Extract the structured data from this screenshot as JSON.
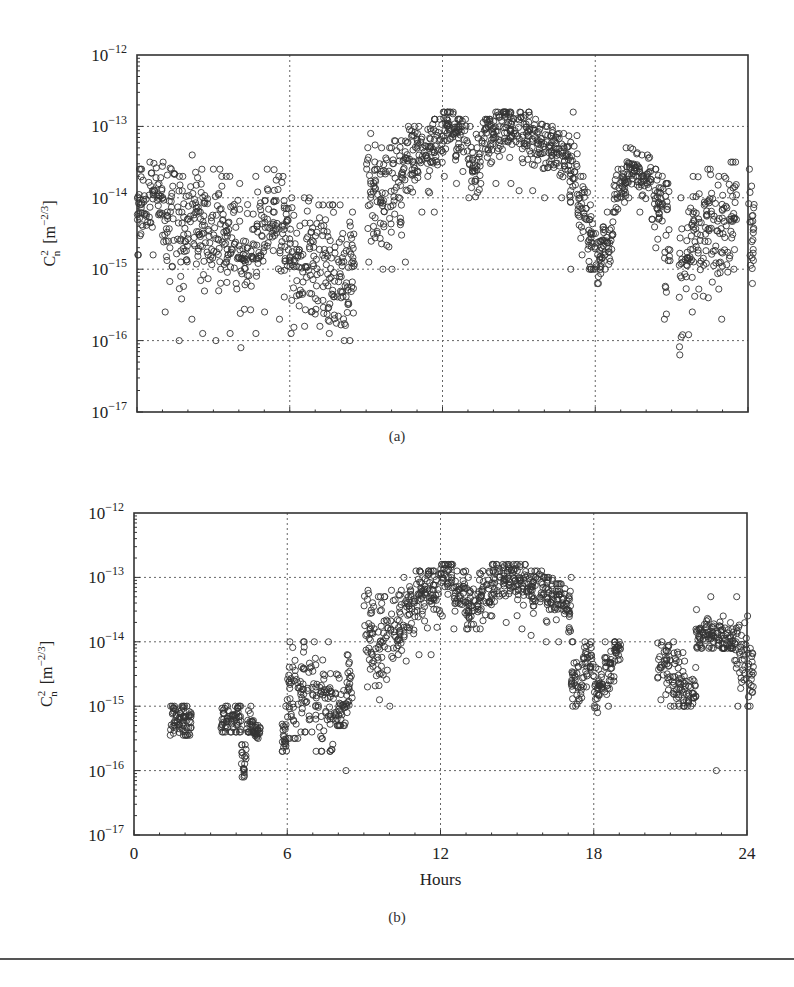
{
  "chart_data": [
    {
      "id": "a",
      "type": "scatter",
      "caption": "(a)",
      "title": "",
      "xlabel": "",
      "ylabel": "C_n^2 [m^-2/3]",
      "ylabel_parts": {
        "base": "C",
        "sup": "2",
        "sub": "n",
        "unit_open": "[m",
        "unit_sup": "−2/3",
        "unit_close": "]"
      },
      "xscale": "linear",
      "yscale": "log",
      "xlim": [
        0,
        24
      ],
      "ylim": [
        1e-17,
        1e-12
      ],
      "xticks": [
        0,
        6,
        12,
        18,
        24
      ],
      "xtick_labels_visible": false,
      "yticks": [
        1e-17,
        1e-16,
        1e-15,
        1e-14,
        1e-13,
        1e-12
      ],
      "ytick_labels": [
        {
          "base": "10",
          "exp": "−17"
        },
        {
          "base": "10",
          "exp": "−16"
        },
        {
          "base": "10",
          "exp": "−15"
        },
        {
          "base": "10",
          "exp": "−14"
        },
        {
          "base": "10",
          "exp": "−13"
        },
        {
          "base": "10",
          "exp": "−12"
        }
      ],
      "grid": true,
      "marker": "open-circle",
      "series": [
        {
          "name": "Cn2 measurements (full day)",
          "description": "Scatter envelope: hour, median log10(Cn2), spread (log decades), min log10, max log10",
          "envelope": [
            [
              0.0,
              -14.1,
              0.6,
              -14.8,
              -13.6
            ],
            [
              0.5,
              -14.0,
              0.6,
              -14.8,
              -13.5
            ],
            [
              1.0,
              -14.3,
              0.8,
              -15.6,
              -13.5
            ],
            [
              1.5,
              -14.6,
              0.9,
              -16.0,
              -13.7
            ],
            [
              2.0,
              -14.3,
              0.8,
              -15.7,
              -13.4
            ],
            [
              2.5,
              -14.5,
              0.9,
              -15.9,
              -13.6
            ],
            [
              3.0,
              -14.4,
              0.9,
              -16.0,
              -13.6
            ],
            [
              3.5,
              -14.6,
              0.9,
              -15.9,
              -13.7
            ],
            [
              4.0,
              -14.9,
              1.0,
              -16.1,
              -13.8
            ],
            [
              4.5,
              -14.6,
              0.9,
              -15.9,
              -13.7
            ],
            [
              5.0,
              -14.3,
              0.7,
              -15.6,
              -13.6
            ],
            [
              5.5,
              -14.5,
              0.8,
              -15.7,
              -13.7
            ],
            [
              6.0,
              -14.9,
              0.9,
              -15.9,
              -14.0
            ],
            [
              6.5,
              -14.9,
              0.9,
              -15.8,
              -14.0
            ],
            [
              7.0,
              -15.0,
              0.9,
              -15.8,
              -14.1
            ],
            [
              7.5,
              -15.1,
              1.0,
              -15.9,
              -14.1
            ],
            [
              8.0,
              -15.3,
              0.9,
              -16.0,
              -14.5
            ],
            [
              8.3,
              -15.0,
              0.8,
              -16.0,
              -14.2
            ],
            [
              9.0,
              -13.9,
              0.8,
              -14.9,
              -13.1
            ],
            [
              9.5,
              -14.0,
              0.8,
              -15.0,
              -13.3
            ],
            [
              10.0,
              -13.8,
              0.7,
              -15.0,
              -13.2
            ],
            [
              10.5,
              -13.4,
              0.6,
              -14.9,
              -13.0
            ],
            [
              11.0,
              -13.4,
              0.5,
              -14.2,
              -13.0
            ],
            [
              11.5,
              -13.2,
              0.5,
              -14.2,
              -12.9
            ],
            [
              12.0,
              -13.0,
              0.4,
              -13.7,
              -12.8
            ],
            [
              12.5,
              -13.2,
              0.4,
              -13.8,
              -12.9
            ],
            [
              13.0,
              -13.5,
              0.4,
              -14.0,
              -13.0
            ],
            [
              13.5,
              -13.2,
              0.4,
              -13.8,
              -12.9
            ],
            [
              14.0,
              -13.0,
              0.4,
              -13.8,
              -12.8
            ],
            [
              14.5,
              -13.0,
              0.4,
              -13.8,
              -12.8
            ],
            [
              15.0,
              -13.1,
              0.4,
              -13.9,
              -12.8
            ],
            [
              15.5,
              -13.2,
              0.4,
              -13.9,
              -12.9
            ],
            [
              16.0,
              -13.3,
              0.4,
              -14.0,
              -13.0
            ],
            [
              16.5,
              -13.4,
              0.4,
              -14.0,
              -13.1
            ],
            [
              17.0,
              -13.6,
              0.5,
              -15.0,
              -12.8
            ],
            [
              17.3,
              -14.1,
              0.5,
              -14.8,
              -13.7
            ],
            [
              17.7,
              -14.6,
              0.5,
              -15.0,
              -14.1
            ],
            [
              18.0,
              -14.9,
              0.4,
              -15.2,
              -14.5
            ],
            [
              18.3,
              -14.6,
              0.4,
              -15.0,
              -14.2
            ],
            [
              18.7,
              -13.9,
              0.3,
              -14.2,
              -13.6
            ],
            [
              19.2,
              -13.6,
              0.3,
              -14.0,
              -13.3
            ],
            [
              19.7,
              -13.7,
              0.3,
              -14.2,
              -13.4
            ],
            [
              20.2,
              -14.1,
              0.5,
              -14.7,
              -13.6
            ],
            [
              20.7,
              -14.6,
              0.9,
              -15.7,
              -13.8
            ],
            [
              21.3,
              -15.0,
              1.0,
              -16.2,
              -14.0
            ],
            [
              21.8,
              -14.5,
              0.9,
              -15.6,
              -13.7
            ],
            [
              22.3,
              -14.4,
              0.8,
              -15.4,
              -13.6
            ],
            [
              22.8,
              -14.5,
              0.9,
              -15.7,
              -13.7
            ],
            [
              23.3,
              -14.2,
              0.8,
              -15.0,
              -13.5
            ],
            [
              24.0,
              -14.4,
              0.8,
              -15.2,
              -13.6
            ]
          ]
        }
      ]
    },
    {
      "id": "b",
      "type": "scatter",
      "caption": "(b)",
      "title": "",
      "xlabel": "Hours",
      "ylabel": "C_n^2 [m^-2/3]",
      "ylabel_parts": {
        "base": "C",
        "sup": "2",
        "sub": "n",
        "unit_open": "[m",
        "unit_sup": "−2/3",
        "unit_close": "]"
      },
      "xscale": "linear",
      "yscale": "log",
      "xlim": [
        0,
        24
      ],
      "ylim": [
        1e-17,
        1e-12
      ],
      "xticks": [
        0,
        6,
        12,
        18,
        24
      ],
      "xtick_labels": [
        "0",
        "6",
        "12",
        "18",
        "24"
      ],
      "xtick_labels_visible": true,
      "yticks": [
        1e-17,
        1e-16,
        1e-15,
        1e-14,
        1e-13,
        1e-12
      ],
      "ytick_labels": [
        {
          "base": "10",
          "exp": "−17"
        },
        {
          "base": "10",
          "exp": "−16"
        },
        {
          "base": "10",
          "exp": "−15"
        },
        {
          "base": "10",
          "exp": "−14"
        },
        {
          "base": "10",
          "exp": "−13"
        },
        {
          "base": "10",
          "exp": "−12"
        }
      ],
      "grid": true,
      "marker": "open-circle",
      "series": [
        {
          "name": "Cn2 measurements (filtered)",
          "description": "Scatter envelope: hour, median log10(Cn2), spread (log decades), min log10, max log10",
          "envelope": [
            [
              1.4,
              -15.2,
              0.3,
              -15.45,
              -15.0
            ],
            [
              1.8,
              -15.2,
              0.3,
              -15.45,
              -15.0
            ],
            [
              2.0,
              -15.3,
              0.3,
              -15.45,
              -15.0
            ],
            [
              3.4,
              -15.2,
              0.3,
              -15.4,
              -15.0
            ],
            [
              3.9,
              -15.2,
              0.3,
              -15.4,
              -15.0
            ],
            [
              4.2,
              -15.8,
              0.3,
              -16.1,
              -15.6
            ],
            [
              4.4,
              -15.3,
              0.3,
              -15.4,
              -15.0
            ],
            [
              4.7,
              -15.4,
              0.1,
              -15.5,
              -15.3
            ],
            [
              5.8,
              -15.5,
              0.4,
              -15.7,
              -15.0
            ],
            [
              6.0,
              -14.8,
              0.8,
              -15.5,
              -14.0
            ],
            [
              6.5,
              -14.8,
              0.8,
              -15.4,
              -14.0
            ],
            [
              7.0,
              -15.0,
              0.8,
              -15.7,
              -14.0
            ],
            [
              7.5,
              -15.0,
              0.8,
              -15.7,
              -14.0
            ],
            [
              7.9,
              -15.1,
              0.5,
              -15.3,
              -14.5
            ],
            [
              8.3,
              -14.7,
              0.5,
              -15.1,
              -14.2
            ],
            [
              9.0,
              -13.9,
              0.7,
              -14.7,
              -13.2
            ],
            [
              9.5,
              -14.0,
              0.8,
              -14.9,
              -13.3
            ],
            [
              10.0,
              -13.8,
              0.7,
              -15.0,
              -13.2
            ],
            [
              10.5,
              -13.5,
              0.6,
              -14.3,
              -13.0
            ],
            [
              11.0,
              -13.3,
              0.5,
              -14.2,
              -12.9
            ],
            [
              11.5,
              -13.2,
              0.5,
              -14.2,
              -12.9
            ],
            [
              12.0,
              -13.0,
              0.4,
              -13.6,
              -12.8
            ],
            [
              12.5,
              -13.2,
              0.4,
              -13.8,
              -12.9
            ],
            [
              13.0,
              -13.5,
              0.4,
              -13.8,
              -13.0
            ],
            [
              13.5,
              -13.2,
              0.4,
              -13.8,
              -12.9
            ],
            [
              14.0,
              -13.0,
              0.4,
              -13.6,
              -12.8
            ],
            [
              14.5,
              -13.0,
              0.4,
              -13.7,
              -12.8
            ],
            [
              15.0,
              -13.1,
              0.4,
              -13.8,
              -12.8
            ],
            [
              15.5,
              -13.2,
              0.4,
              -13.9,
              -12.9
            ],
            [
              16.0,
              -13.3,
              0.4,
              -14.0,
              -13.0
            ],
            [
              16.5,
              -13.4,
              0.4,
              -14.0,
              -13.1
            ],
            [
              17.0,
              -13.5,
              0.5,
              -14.0,
              -13.0
            ],
            [
              17.1,
              -14.6,
              0.4,
              -15.0,
              -14.0
            ],
            [
              17.6,
              -14.3,
              0.4,
              -14.7,
              -14.0
            ],
            [
              18.0,
              -14.8,
              0.4,
              -15.1,
              -14.4
            ],
            [
              18.4,
              -14.5,
              0.4,
              -15.0,
              -14.0
            ],
            [
              18.8,
              -14.1,
              0.2,
              -14.3,
              -14.0
            ],
            [
              20.5,
              -14.4,
              0.4,
              -14.9,
              -14.0
            ],
            [
              21.0,
              -14.6,
              0.5,
              -15.0,
              -14.0
            ],
            [
              21.5,
              -14.8,
              0.4,
              -15.0,
              -14.3
            ],
            [
              22.0,
              -13.9,
              0.3,
              -14.1,
              -13.5
            ],
            [
              22.5,
              -13.9,
              0.3,
              -14.1,
              -13.3
            ],
            [
              23.0,
              -14.0,
              0.3,
              -14.1,
              -13.6
            ],
            [
              23.5,
              -14.2,
              0.5,
              -15.0,
              -13.3
            ],
            [
              24.0,
              -14.5,
              0.6,
              -15.0,
              -13.6
            ]
          ],
          "outliers": [
            [
              8.3,
              -16.0
            ],
            [
              22.8,
              -16.0
            ]
          ]
        }
      ]
    }
  ],
  "figure": {
    "captions": [
      "(a)",
      "(b)"
    ]
  }
}
